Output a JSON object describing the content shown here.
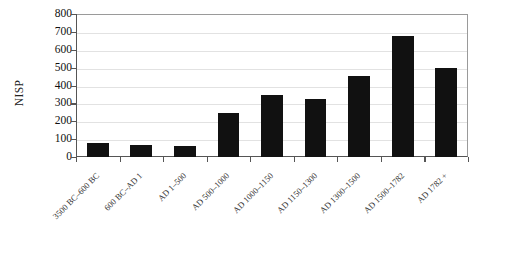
{
  "chart_data": {
    "type": "bar",
    "title": "",
    "xlabel": "",
    "ylabel": "NISP",
    "ylim": [
      0,
      800
    ],
    "ytick_step": 100,
    "grid": true,
    "legend": "none",
    "bar_color": "#111111",
    "categories": [
      "3500 BC–600 BC",
      "600 BC–AD 1",
      "AD 1–500",
      "AD 500–1000",
      "AD 1000–1150",
      "AD 1150–1300",
      "AD 1300–1500",
      "AD 1500–1782",
      "AD 1782 +"
    ],
    "values": [
      78,
      65,
      63,
      245,
      348,
      322,
      455,
      680,
      500
    ],
    "ytick_labels": [
      "800",
      "700",
      "600",
      "500",
      "400",
      "300",
      "200",
      "100",
      "0"
    ],
    "ytick_values": [
      800,
      700,
      600,
      500,
      400,
      300,
      200,
      100,
      0
    ]
  }
}
